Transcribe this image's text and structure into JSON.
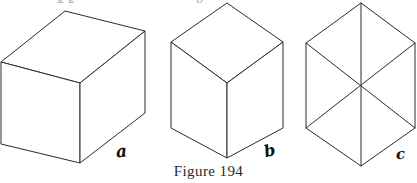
{
  "figure": {
    "caption": "Figure 194",
    "top_text_remnant_left": "g g",
    "top_text_remnant_right": "p",
    "ink_color": "#2b2b2b",
    "background_color": "#ffffff",
    "panels": [
      {
        "id": "a",
        "label": "a",
        "name": "rectangular-box-drawing",
        "description": "Line drawing of a rectangular box (cuboid) seen from above-left, three faces visible: top, left and right.",
        "vertices": {
          "top": [
            65,
            11
          ],
          "top_right": [
            145,
            31
          ],
          "left": [
            1,
            62
          ],
          "center": [
            80,
            83
          ],
          "bottom": [
            80,
            163
          ],
          "right_bottom": [
            145,
            113
          ],
          "left_bottom": [
            1,
            144
          ]
        },
        "faces": [
          {
            "name": "top-face",
            "points": "65,11 145,31 80,83 1,62"
          },
          {
            "name": "left-face",
            "points": "1,62 80,83 80,163 1,144"
          },
          {
            "name": "right-face",
            "points": "80,83 145,31 145,113 80,163"
          }
        ]
      },
      {
        "id": "b",
        "label": "b",
        "name": "isometric-cube-drawing",
        "description": "Line drawing of a cube in isometric projection, three rhombus faces meeting at the centre vertex.",
        "vertices": {
          "top": [
            227,
            3
          ],
          "upper_left": [
            171,
            42
          ],
          "upper_right": [
            283,
            42
          ],
          "center": [
            227,
            83
          ],
          "lower_left": [
            171,
            128
          ],
          "lower_right": [
            283,
            128
          ],
          "bottom": [
            227,
            158
          ]
        },
        "faces": [
          {
            "name": "top-face",
            "points": "227,3 283,42 227,83 171,42"
          },
          {
            "name": "left-face",
            "points": "171,42 227,83 227,158 171,128"
          },
          {
            "name": "right-face",
            "points": "227,83 283,42 283,128 227,158"
          }
        ]
      },
      {
        "id": "c",
        "label": "c",
        "name": "hexagon-six-triangles-drawing",
        "description": "Regular hexagon divided by its three long diagonals into six equal triangles.",
        "vertices": {
          "top": [
            361,
            3
          ],
          "upper_left": [
            306,
            43
          ],
          "upper_right": [
            415,
            43
          ],
          "center": [
            361,
            85
          ],
          "lower_left": [
            306,
            128
          ],
          "lower_right": [
            415,
            128
          ],
          "bottom": [
            361,
            166
          ]
        },
        "outline": "361,3 415,43 415,128 361,166 306,128 306,43",
        "diagonals": [
          {
            "name": "vertical-diagonal",
            "from": [
              361,
              3
            ],
            "to": [
              361,
              166
            ]
          },
          {
            "name": "diagonal-upper-left-to-lower-right",
            "from": [
              306,
              43
            ],
            "to": [
              415,
              128
            ]
          },
          {
            "name": "diagonal-upper-right-to-lower-left",
            "from": [
              415,
              43
            ],
            "to": [
              306,
              128
            ]
          }
        ]
      }
    ]
  }
}
